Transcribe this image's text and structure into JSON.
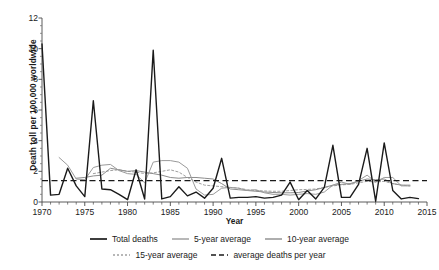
{
  "chart_data": {
    "type": "line",
    "title": "",
    "xlabel": "Year",
    "ylabel": "Death toll per 100,000 worldwide",
    "xlim": [
      1970,
      2015
    ],
    "ylim": [
      0,
      12
    ],
    "yticks": [
      0,
      2,
      4,
      6,
      8,
      10,
      12
    ],
    "xticks": [
      1970,
      1975,
      1980,
      1985,
      1990,
      1995,
      2000,
      2005,
      2010,
      2015
    ],
    "grid": false,
    "legend_position": "bottom",
    "minor_ticks_x": true,
    "x": [
      1970,
      1971,
      1972,
      1973,
      1974,
      1975,
      1976,
      1977,
      1978,
      1979,
      1980,
      1981,
      1982,
      1983,
      1984,
      1985,
      1986,
      1987,
      1988,
      1989,
      1990,
      1991,
      1992,
      1993,
      1994,
      1995,
      1996,
      1997,
      1998,
      1999,
      2000,
      2001,
      2002,
      2003,
      2004,
      2005,
      2006,
      2007,
      2008,
      2009,
      2010,
      2011,
      2012,
      2013,
      2014
    ],
    "series": [
      {
        "name": "Total deaths",
        "color": "#1a1a1a",
        "style": "solid",
        "width": 1.4,
        "values": [
          10.3,
          0.45,
          0.5,
          2.2,
          1.05,
          0.35,
          6.6,
          0.85,
          0.8,
          0.5,
          0.15,
          2.1,
          0.2,
          9.9,
          0.2,
          0.35,
          1.0,
          0.4,
          0.65,
          0.25,
          0.9,
          2.85,
          0.25,
          0.3,
          0.3,
          0.35,
          0.25,
          0.3,
          0.45,
          1.3,
          0.15,
          0.75,
          0.2,
          0.95,
          3.7,
          0.3,
          0.3,
          1.15,
          3.5,
          0.05,
          3.85,
          0.75,
          0.2,
          0.3,
          0.22
        ]
      },
      {
        "name": "5-year average",
        "color": "#9a9a9a",
        "style": "solid",
        "width": 1.0,
        "values": [
          null,
          null,
          2.9,
          2.4,
          1.5,
          1.45,
          2.25,
          2.4,
          2.45,
          2.05,
          1.85,
          1.8,
          1.25,
          2.6,
          2.7,
          2.7,
          2.6,
          2.2,
          0.85,
          0.45,
          0.5,
          0.9,
          0.95,
          0.9,
          0.75,
          0.8,
          0.6,
          0.5,
          0.5,
          0.45,
          0.5,
          0.55,
          0.5,
          0.65,
          1.1,
          1.3,
          1.15,
          1.4,
          1.75,
          1.3,
          1.6,
          1.6,
          1.05,
          1.05,
          null
        ]
      },
      {
        "name": "10-year average",
        "color": "#8c8c8c",
        "style": "solid",
        "width": 1.0,
        "values": [
          null,
          null,
          null,
          null,
          1.55,
          1.6,
          1.7,
          1.75,
          2.2,
          2.1,
          2.0,
          2.05,
          1.95,
          1.85,
          1.75,
          1.6,
          1.55,
          1.6,
          1.6,
          1.55,
          1.5,
          1.2,
          0.85,
          0.8,
          0.75,
          0.7,
          0.65,
          0.62,
          0.6,
          0.6,
          0.62,
          0.72,
          0.8,
          0.95,
          1.1,
          1.15,
          1.2,
          1.35,
          1.5,
          1.45,
          1.5,
          1.2,
          1.1,
          1.1,
          null
        ]
      },
      {
        "name": "15-year average",
        "color": "#a0a0a0",
        "style": "dotted",
        "width": 1.0,
        "values": [
          null,
          null,
          null,
          null,
          null,
          null,
          1.85,
          1.95,
          2.05,
          2.1,
          2.0,
          1.95,
          1.85,
          1.9,
          2.0,
          2.1,
          1.95,
          1.6,
          1.3,
          1.1,
          1.05,
          1.0,
          0.95,
          0.9,
          0.8,
          0.75,
          0.72,
          0.7,
          0.7,
          0.75,
          0.8,
          0.82,
          0.85,
          0.95,
          1.05,
          1.12,
          1.15,
          1.25,
          1.35,
          1.3,
          1.35,
          1.2,
          1.1,
          1.05,
          null
        ]
      },
      {
        "name": "average deaths per year",
        "color": "#1a1a1a",
        "style": "dashed",
        "width": 1.3,
        "constant": 1.4
      }
    ]
  },
  "legend": {
    "items": [
      {
        "label": "Total deaths",
        "icon": "solid-line-swatch"
      },
      {
        "label": "5-year average",
        "icon": "solid-line-swatch"
      },
      {
        "label": "10-year average",
        "icon": "solid-line-swatch"
      },
      {
        "label": "15-year average",
        "icon": "dotted-line-swatch"
      },
      {
        "label": "average deaths per year",
        "icon": "dashed-line-swatch"
      }
    ]
  }
}
